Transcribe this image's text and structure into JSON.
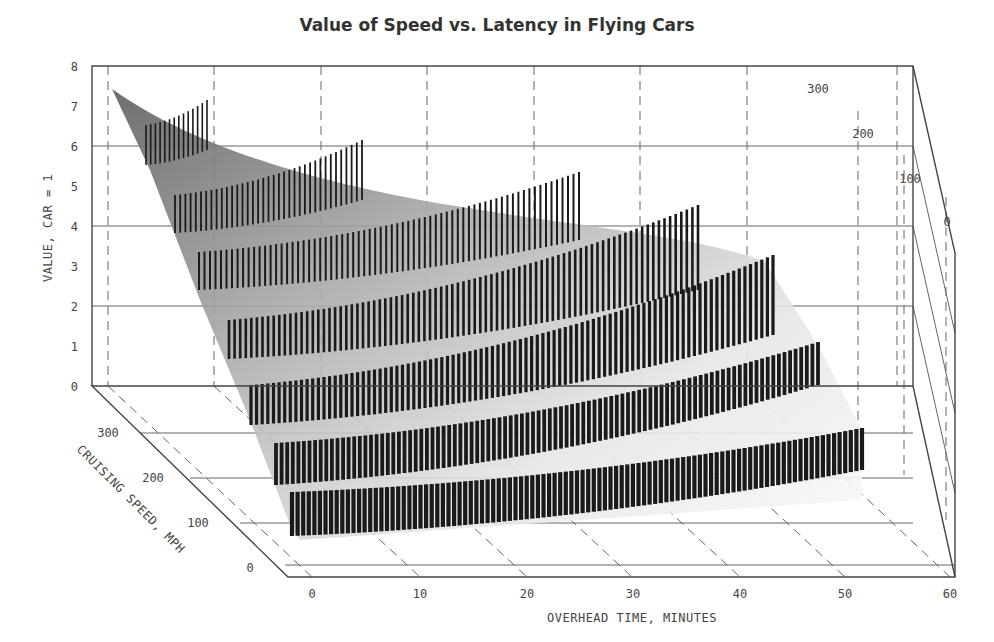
{
  "title": "Value of Speed vs. Latency in Flying Cars",
  "axes": {
    "x_label": "OVERHEAD TIME, MINUTES",
    "y_label": "VALUE, CAR = 1",
    "z_label": "CRUISING SPEED, MPH",
    "x_ticks": [
      "0",
      "10",
      "20",
      "30",
      "40",
      "50",
      "60"
    ],
    "y_ticks": [
      "0",
      "1",
      "2",
      "3",
      "4",
      "5",
      "6",
      "7",
      "8"
    ],
    "z_ticks_front": [
      "0",
      "100",
      "200",
      "300"
    ],
    "z_ticks_right": [
      "0",
      "100",
      "200",
      "300"
    ]
  },
  "colors": {
    "surface_dark": "#6e6e6e",
    "surface_light": "#f2f2f2",
    "bars": "#1a1a1a",
    "frame": "#444444"
  },
  "chart_data": {
    "type": "3d-surface-with-bars",
    "title": "Value of Speed vs. Latency in Flying Cars",
    "xlabel": "OVERHEAD TIME, MINUTES",
    "ylabel": "VALUE, CAR = 1",
    "zlabel": "CRUISING SPEED, MPH",
    "xlim": [
      0,
      60
    ],
    "ylim": [
      0,
      8
    ],
    "zlim": [
      0,
      300
    ],
    "x_ticks": [
      0,
      10,
      20,
      30,
      40,
      50,
      60
    ],
    "y_ticks": [
      0,
      1,
      2,
      3,
      4,
      5,
      6,
      7,
      8
    ],
    "z_ticks": [
      0,
      100,
      200,
      300
    ],
    "grid": true,
    "legend": null,
    "surface_peak": {
      "overhead_time": 0,
      "cruising_speed": 300,
      "value": 7.4
    },
    "bar_rows_back_to_front": [
      {
        "row": 1,
        "approx_value_start": 5.2,
        "approx_value_end": 6.2,
        "approx_time_range": [
          3,
          10
        ]
      },
      {
        "row": 2,
        "approx_value_start": 4.4,
        "approx_value_end": 5.0,
        "approx_time_range": [
          3,
          24
        ]
      },
      {
        "row": 3,
        "approx_value_start": 3.5,
        "approx_value_end": 4.2,
        "approx_time_range": [
          3,
          37
        ]
      },
      {
        "row": 4,
        "approx_value_start": 2.4,
        "approx_value_end": 3.5,
        "approx_time_range": [
          3,
          47
        ]
      },
      {
        "row": 5,
        "approx_value_start": 1.5,
        "approx_value_end": 2.6,
        "approx_time_range": [
          3,
          53
        ]
      },
      {
        "row": 6,
        "approx_value_start": 0.8,
        "approx_value_end": 2.0,
        "approx_time_range": [
          3,
          57
        ]
      },
      {
        "row": 7,
        "approx_value_start": 0.3,
        "approx_value_end": 1.3,
        "approx_time_range": [
          3,
          60
        ]
      }
    ]
  }
}
